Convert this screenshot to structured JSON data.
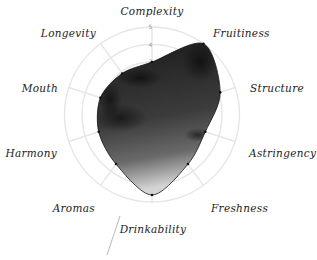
{
  "chart_data": {
    "type": "radar",
    "title": "",
    "axes": [
      "Complexity",
      "Fruitiness",
      "Structure",
      "Astringency",
      "Freshness",
      "Drinkability",
      "Aromas",
      "Harmony",
      "Mouth",
      "Longevity"
    ],
    "series": [
      {
        "name": "Wine profile",
        "values": [
          3.0,
          5.0,
          4.1,
          3.2,
          3.5,
          4.6,
          3.5,
          3.2,
          3.1,
          2.9
        ]
      }
    ],
    "ticks": [
      "1",
      "2",
      "3",
      "4",
      "5"
    ],
    "visible_ticks": [
      "3",
      "4",
      "5"
    ],
    "range": [
      0,
      5
    ],
    "grid": true,
    "legend": "none",
    "fill": "dark textured grayscale (watercolor-like ink fill)"
  },
  "colors": {
    "grid": "#e6e6e6",
    "label": "#222222",
    "tick": "#999999",
    "fill_dark": "#1e1e1e",
    "fill_light": "#d0d0d0",
    "stroke": "#111111",
    "pointer_line": "#aaaaaa"
  }
}
